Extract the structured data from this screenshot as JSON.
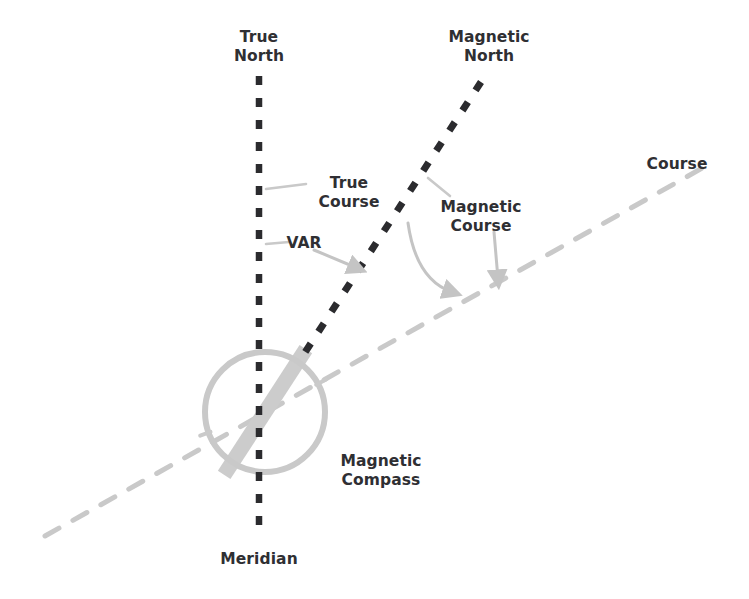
{
  "diagram": {
    "background_color": "#ffffff",
    "colors": {
      "text": "#2f2f33",
      "dark_line": "#2b2b2e",
      "light_line": "#c9c9c9",
      "compass": "#c9c9c9",
      "arrow": "#c4c4c4",
      "leader": "#c9c9c9"
    },
    "labels": {
      "true_north": "True\nNorth",
      "magnetic_north": "Magnetic\nNorth",
      "course": "Course",
      "true_course": "True\nCourse",
      "magnetic_course": "Magnetic\nCourse",
      "var": "VAR",
      "magnetic_compass": "Magnetic\nCompass",
      "meridian": "Meridian"
    },
    "lines": {
      "true_north_meridian": {
        "name": "true-north-meridian-line",
        "style": "dashed",
        "color": "#2b2b2e",
        "x1": 259,
        "y1": 76,
        "x2": 259,
        "y2": 533
      },
      "magnetic_north": {
        "name": "magnetic-north-line",
        "style": "dashed",
        "color": "#2b2b2e",
        "x1": 481,
        "y1": 82,
        "x2": 300,
        "y2": 360
      },
      "course": {
        "name": "course-line",
        "style": "dashed",
        "color": "#c9c9c9",
        "x1": 45,
        "y1": 536,
        "x2": 706,
        "y2": 166
      }
    },
    "compass": {
      "name": "magnetic-compass",
      "center_x": 265,
      "center_y": 412,
      "radius": 60,
      "needle_angle_deg": -57,
      "needle_length": 150,
      "needle_width": 15,
      "color": "#c9c9c9"
    },
    "arrows": [
      {
        "name": "var-arrow",
        "label": "VAR",
        "x1": 314,
        "y1": 250,
        "x2": 357,
        "y2": 268
      },
      {
        "name": "magnetic-course-arrow",
        "label": "Magnetic Course",
        "x1": 494,
        "y1": 232,
        "x2": 498,
        "y2": 279
      },
      {
        "name": "variation-curve-arrow",
        "label": "variation curve",
        "x1": 408,
        "y1": 223,
        "x2": 452,
        "y2": 292
      }
    ],
    "leaders": [
      {
        "name": "true-course-leader",
        "x1": 266,
        "y1": 189,
        "x2": 306,
        "y2": 184
      },
      {
        "name": "var-leader",
        "x1": 266,
        "y1": 244,
        "x2": 289,
        "y2": 242
      },
      {
        "name": "magnetic-course-leader",
        "x1": 428,
        "y1": 178,
        "x2": 450,
        "y2": 196
      }
    ],
    "label_positions": {
      "true_north": {
        "x": 259,
        "y": 28
      },
      "magnetic_north": {
        "x": 489,
        "y": 28
      },
      "course": {
        "x": 677,
        "y": 155
      },
      "true_course": {
        "x": 349,
        "y": 174
      },
      "magnetic_course": {
        "x": 481,
        "y": 198
      },
      "var": {
        "x": 304,
        "y": 234
      },
      "magnetic_compass": {
        "x": 381,
        "y": 452
      },
      "meridian": {
        "x": 259,
        "y": 550
      }
    }
  }
}
